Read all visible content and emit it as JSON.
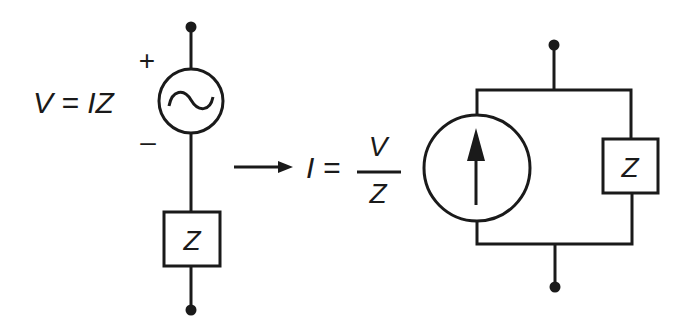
{
  "diagram": {
    "left_circuit": {
      "equation": "V = IZ",
      "polarity_plus": "+",
      "polarity_minus": "–",
      "source_type": "ac-voltage-source",
      "source_symbol": "~",
      "impedance_label": "Z",
      "connection": "series"
    },
    "transform": {
      "arrow": "right-arrow",
      "equation_lhs": "I =",
      "numerator": "V",
      "denominator": "Z"
    },
    "right_circuit": {
      "source_type": "current-source",
      "source_direction": "up",
      "impedance_label": "Z",
      "connection": "parallel"
    },
    "colors": {
      "ink": "#1a1a1a",
      "background": "#ffffff"
    }
  }
}
